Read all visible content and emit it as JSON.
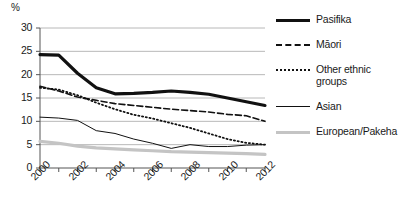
{
  "chart_data": {
    "type": "line",
    "title": "",
    "xlabel": "",
    "ylabel": "%",
    "ylim": [
      0,
      30
    ],
    "yticks": [
      0,
      5,
      10,
      15,
      20,
      25,
      30
    ],
    "grid": true,
    "legend_position": "right",
    "x": [
      2000,
      2001,
      2002,
      2003,
      2004,
      2005,
      2006,
      2007,
      2008,
      2009,
      2010,
      2011,
      2012
    ],
    "xtick_labels": [
      "2000",
      "2002",
      "2004",
      "2006",
      "2008",
      "2010",
      "2012"
    ],
    "xticks": [
      2000,
      2002,
      2004,
      2006,
      2008,
      2010,
      2012
    ],
    "series": [
      {
        "name": "Pasifika",
        "style": "solid-thick",
        "color": "#111111",
        "values": [
          24.3,
          24.2,
          20.3,
          17.2,
          15.9,
          16.0,
          16.2,
          16.5,
          16.2,
          15.8,
          15.0,
          14.2,
          13.4
        ]
      },
      {
        "name": "Māori",
        "style": "dashed",
        "color": "#111111",
        "values": [
          17.5,
          16.5,
          15.2,
          14.5,
          13.8,
          13.4,
          13.0,
          12.6,
          12.3,
          12.0,
          11.5,
          11.2,
          10.0
        ]
      },
      {
        "name": "Other ethnic\ngroups",
        "style": "dotted",
        "color": "#111111",
        "values": [
          17.2,
          16.8,
          15.6,
          14.0,
          12.6,
          11.4,
          10.6,
          9.6,
          8.6,
          7.4,
          6.2,
          5.4,
          5.0
        ]
      },
      {
        "name": "Asian",
        "style": "solid-thin",
        "color": "#111111",
        "values": [
          10.9,
          10.7,
          10.2,
          8.0,
          7.4,
          6.2,
          5.3,
          4.2,
          5.0,
          4.6,
          4.6,
          4.9,
          5.0
        ]
      },
      {
        "name": "European/Pakeha",
        "style": "solid-thick-gray",
        "color": "#c4c4c4",
        "values": [
          5.7,
          5.3,
          4.7,
          4.3,
          4.1,
          3.9,
          3.7,
          3.5,
          3.4,
          3.3,
          3.2,
          3.1,
          2.9
        ]
      }
    ]
  },
  "axis": {
    "unit_label": "%",
    "y_labels": [
      "30",
      "25",
      "20",
      "15",
      "10",
      "5",
      "0"
    ],
    "x_labels": [
      "2000",
      "2002",
      "2004",
      "2006",
      "2008",
      "2010",
      "2012"
    ]
  },
  "legend": {
    "items": [
      {
        "label": "Pasifika"
      },
      {
        "label": "Māori"
      },
      {
        "label": "Other ethnic\ngroups"
      },
      {
        "label": "Asian"
      },
      {
        "label": "European/Pakeha"
      }
    ]
  },
  "colors": {
    "gridline": "#b8b8b8",
    "axis": "#555555",
    "ink": "#111111",
    "european_line": "#c4c4c4",
    "background": "#ffffff"
  }
}
